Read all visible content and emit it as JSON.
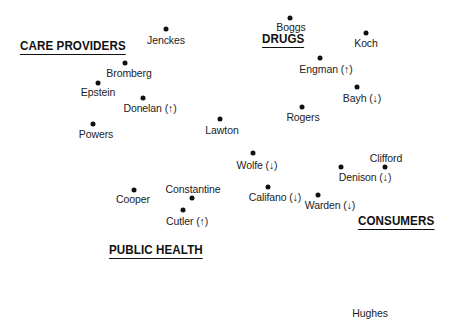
{
  "diagram": {
    "groups": [
      {
        "id": "care-providers",
        "label": "CARE PROVIDERS",
        "x": 20,
        "y": 39
      },
      {
        "id": "drugs",
        "label": "DRUGS",
        "x": 262,
        "y": 32
      },
      {
        "id": "consumers",
        "label": "CONSUMERS",
        "x": 358,
        "y": 214
      },
      {
        "id": "public-health",
        "label": "PUBLIC HEALTH",
        "x": 109,
        "y": 243
      }
    ],
    "points": [
      {
        "name": "Jenckes",
        "trend": "",
        "label": "Jenckes",
        "dot": [
          166,
          29
        ],
        "text": [
          166,
          40
        ]
      },
      {
        "name": "Boggs",
        "trend": "",
        "label": "Boggs",
        "dot": [
          290,
          18
        ],
        "text": [
          291,
          27
        ]
      },
      {
        "name": "Koch",
        "trend": "",
        "label": "Koch",
        "dot": [
          366,
          33
        ],
        "text": [
          366,
          43
        ]
      },
      {
        "name": "Bromberg",
        "trend": "",
        "label": "Bromberg",
        "dot": [
          125,
          63
        ],
        "text": [
          129,
          73
        ]
      },
      {
        "name": "Epstein",
        "trend": "",
        "label": "Epstein",
        "dot": [
          98,
          83
        ],
        "text": [
          98,
          92
        ]
      },
      {
        "name": "Donelan",
        "trend": "up",
        "label": "Donelan (↑)",
        "dot": [
          143,
          98
        ],
        "text": [
          150,
          108
        ]
      },
      {
        "name": "Engman",
        "trend": "up",
        "label": "Engman (↑)",
        "dot": [
          320,
          58
        ],
        "text": [
          326,
          69
        ]
      },
      {
        "name": "Bayh",
        "trend": "down",
        "label": "Bayh (↓)",
        "dot": [
          357,
          87
        ],
        "text": [
          362,
          98
        ]
      },
      {
        "name": "Rogers",
        "trend": "",
        "label": "Rogers",
        "dot": [
          302,
          107
        ],
        "text": [
          303,
          117
        ]
      },
      {
        "name": "Powers",
        "trend": "",
        "label": "Powers",
        "dot": [
          93,
          124
        ],
        "text": [
          96,
          134
        ]
      },
      {
        "name": "Lawton",
        "trend": "",
        "label": "Lawton",
        "dot": [
          220,
          119
        ],
        "text": [
          222,
          130
        ]
      },
      {
        "name": "Wolfe",
        "trend": "down",
        "label": "Wolfe (↓)",
        "dot": [
          253,
          153
        ],
        "text": [
          257,
          165
        ]
      },
      {
        "name": "Clifford",
        "trend": "",
        "label": "Clifford",
        "dot": [
          385,
          167
        ],
        "text": [
          386,
          158
        ]
      },
      {
        "name": "Denison",
        "trend": "down",
        "label": "Denison (↓)",
        "dot": [
          341,
          167
        ],
        "text": [
          365,
          177
        ]
      },
      {
        "name": "Califano",
        "trend": "down",
        "label": "Califano (↓)",
        "dot": [
          268,
          187
        ],
        "text": [
          275,
          197
        ]
      },
      {
        "name": "Warden",
        "trend": "down",
        "label": "Warden (↓)",
        "dot": [
          318,
          195
        ],
        "text": [
          330,
          205
        ]
      },
      {
        "name": "Cooper",
        "trend": "",
        "label": "Cooper",
        "dot": [
          134,
          190
        ],
        "text": [
          133,
          199
        ]
      },
      {
        "name": "Constantine",
        "trend": "",
        "label": "Constantine",
        "dot": [
          192,
          198
        ],
        "text": [
          193,
          189
        ]
      },
      {
        "name": "Cutler",
        "trend": "up",
        "label": "Cutler (↑)",
        "dot": [
          183,
          210
        ],
        "text": [
          187,
          221
        ]
      },
      {
        "name": "Hughes",
        "trend": "",
        "label": "Hughes",
        "dot": null,
        "text": [
          370,
          313
        ]
      }
    ],
    "colors": {
      "ink": "#111111",
      "background": "#ffffff"
    }
  }
}
